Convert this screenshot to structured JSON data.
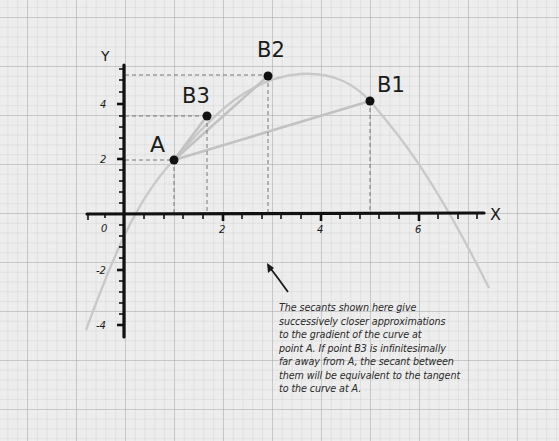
{
  "diagram": {
    "type": "secant approximations to tangent",
    "axes": {
      "x_label": "X",
      "y_label": "Y",
      "x_ticks": [
        {
          "value": 0,
          "label": "0"
        },
        {
          "value": 2,
          "label": "2"
        },
        {
          "value": 4,
          "label": "4"
        },
        {
          "value": 6,
          "label": "6"
        }
      ],
      "y_ticks": [
        {
          "value": 4,
          "label": "4"
        },
        {
          "value": 2,
          "label": "2"
        },
        {
          "value": -2,
          "label": "-2"
        },
        {
          "value": -4,
          "label": "-4"
        }
      ]
    },
    "points": [
      {
        "id": "A",
        "label": "A",
        "x": 1,
        "y": 2
      },
      {
        "id": "B3",
        "label": "B3",
        "x": 1.7,
        "y": 3.6
      },
      {
        "id": "B2",
        "label": "B2",
        "x": 2.95,
        "y": 5
      },
      {
        "id": "B1",
        "label": "B1",
        "x": 5,
        "y": 4.1
      }
    ],
    "secants": [
      {
        "from": "A",
        "to": "B1"
      },
      {
        "from": "A",
        "to": "B2"
      },
      {
        "from": "A",
        "to": "B3"
      }
    ],
    "curve": "smooth concave-down curve rising through A, peaking near x=3.5–4, falling steeply past x=5",
    "annotation": "The secants shown here give successively closer approximations to the gradient of the curve at point A. If point B3 is infinitesimally far away from A, the secant between them will be equivalent to the tangent to the curve at A."
  },
  "labels": {
    "x_axis": "X",
    "y_axis": "Y",
    "x0": "0",
    "x2": "2",
    "x4": "4",
    "x6": "6",
    "y4": "4",
    "y2": "2",
    "yn2": "-2",
    "yn4": "-4",
    "A": "A",
    "B1": "B1",
    "B2": "B2",
    "B3": "B3"
  },
  "annotation_lines": [
    "The secants shown here give",
    "successively closer approximations",
    "to the gradient of the curve at",
    "point A. If point B3 is infinitesimally",
    "far away from A, the secant between",
    "them will be equivalent to the tangent",
    "to the curve at A."
  ],
  "colors": {
    "axis": "#111111",
    "curve": "#c9c9c9",
    "secant": "#c2c2c2",
    "guide": "#777777",
    "point": "#111111",
    "paper": "#ededed"
  }
}
